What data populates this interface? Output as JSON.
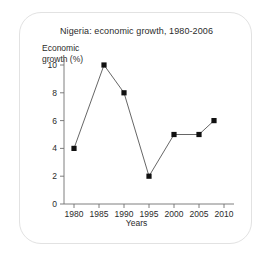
{
  "chart_data": {
    "type": "line",
    "title": "Nigeria: economic growth, 1980-2006",
    "xlabel": "Years",
    "ylabel": "Economic growth (%)",
    "ylabel_line1": "Economic",
    "ylabel_line2": "growth (%)",
    "x": [
      1980,
      1986,
      1990,
      1995,
      2000,
      2005,
      2008
    ],
    "values": [
      4,
      10,
      8,
      2,
      5,
      5,
      6
    ],
    "xlim": [
      1978,
      2012
    ],
    "ylim": [
      0,
      10
    ],
    "xticks": [
      "1980",
      "1985",
      "1990",
      "1995",
      "2000",
      "2005",
      "2010"
    ],
    "xtick_values": [
      1980,
      1985,
      1990,
      1995,
      2000,
      2005,
      2010
    ],
    "yticks": [
      "0",
      "2",
      "4",
      "6",
      "8",
      "10"
    ],
    "ytick_values": [
      0,
      2,
      4,
      6,
      8,
      10
    ],
    "grid": false,
    "legend": false,
    "marker": "square",
    "line_color": "#555555",
    "marker_color": "#111111",
    "axis_color": "#6f6f6f",
    "text_color": "#2b2b2b",
    "background_color": "#ffffff",
    "border_color": "#e2e2e2"
  }
}
